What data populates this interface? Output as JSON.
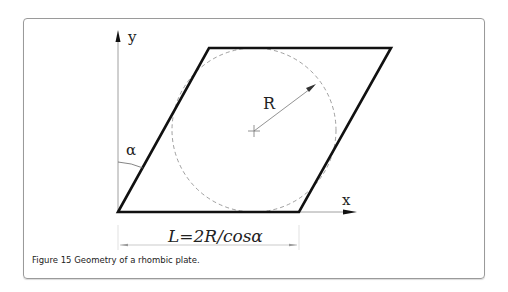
{
  "figure": {
    "axis_labels": {
      "y": "y",
      "x": "x"
    },
    "radius_label": "R",
    "angle_label": "α",
    "dimension_label": "L=2R/cosα",
    "caption": "Figure 15 Geometry of a rhombic plate."
  }
}
